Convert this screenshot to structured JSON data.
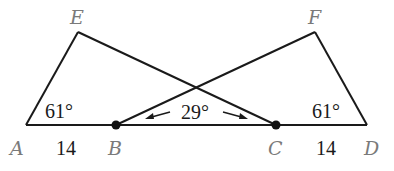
{
  "diagram": {
    "points": {
      "A": {
        "label": "A",
        "x": 26,
        "y": 125
      },
      "B": {
        "label": "B",
        "x": 116,
        "y": 125
      },
      "C": {
        "label": "C",
        "x": 276,
        "y": 125
      },
      "D": {
        "label": "D",
        "x": 367,
        "y": 125
      },
      "E": {
        "label": "E",
        "x": 78,
        "y": 32
      },
      "F": {
        "label": "F",
        "x": 315,
        "y": 32
      }
    },
    "segments": [
      "AD",
      "AE",
      "EC",
      "BF",
      "FD"
    ],
    "marked_points": [
      "B",
      "C"
    ],
    "angles": {
      "angle_A": "61°",
      "angle_D": "61°",
      "angle_between": "29°"
    },
    "lengths": {
      "AB": "14",
      "CD": "14"
    }
  }
}
